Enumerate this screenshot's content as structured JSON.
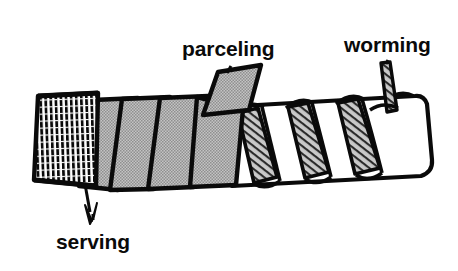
{
  "figure": {
    "background_color": "#ffffff",
    "ink_color": "#0a0a0a",
    "fill_gray": "#b0b0b0",
    "fill_white": "#ffffff",
    "labels": {
      "parceling": "parceling",
      "worming": "worming",
      "serving": "serving"
    },
    "parts": [
      {
        "name": "serving",
        "description": "tightly wound twine grid at rope end",
        "fill": "#ffffff",
        "pattern": "vertical-bar-grid"
      },
      {
        "name": "parceling",
        "description": "gray tape strips spiralled over the rope",
        "fill": "#b0b0b0",
        "pattern": "solid-gray",
        "strip_count": 4
      },
      {
        "name": "worming",
        "description": "thin hatched filler strands laid in rope lays",
        "fill": "#b0b0b0",
        "pattern": "diagonal-hatch",
        "strand_count": 4
      },
      {
        "name": "rope",
        "description": "white twisted rope strands",
        "fill": "#ffffff",
        "pattern": "solid-white"
      }
    ]
  }
}
